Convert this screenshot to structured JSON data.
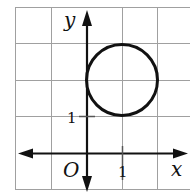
{
  "diagram": {
    "type": "coordinate-plane-circle",
    "grid": {
      "x_min": -2,
      "x_max": 3,
      "y_min": -1,
      "y_max": 4,
      "step": 1,
      "color": "#9a9a9a"
    },
    "axes": {
      "x_label": "x",
      "y_label": "y",
      "origin_label": "O",
      "color": "#111111"
    },
    "ticks": {
      "x_tick_label": "1",
      "y_tick_label": "1"
    },
    "circle": {
      "center": [
        1,
        2
      ],
      "radius": 1,
      "stroke": "#111111"
    }
  }
}
